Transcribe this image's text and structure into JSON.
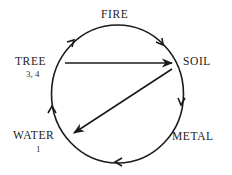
{
  "diagram": {
    "type": "cycle",
    "nodes": [
      {
        "id": "fire",
        "label": "FIRE",
        "sub": ""
      },
      {
        "id": "soil",
        "label": "SOIL",
        "sub": ""
      },
      {
        "id": "metal",
        "label": "METAL",
        "sub": ""
      },
      {
        "id": "water",
        "label": "WATER",
        "sub": "1"
      },
      {
        "id": "tree",
        "label": "TREE",
        "sub": "3, 4"
      }
    ],
    "cycle_edges": [
      {
        "from": "tree",
        "to": "fire"
      },
      {
        "from": "fire",
        "to": "soil"
      },
      {
        "from": "soil",
        "to": "metal"
      },
      {
        "from": "metal",
        "to": "water"
      },
      {
        "from": "water",
        "to": "tree"
      }
    ],
    "chord_edges": [
      {
        "from": "tree",
        "to": "soil"
      },
      {
        "from": "soil",
        "to": "water"
      }
    ],
    "colors": {
      "stroke": "#1a1a1a",
      "text": "#222222",
      "background": "#ffffff"
    }
  }
}
